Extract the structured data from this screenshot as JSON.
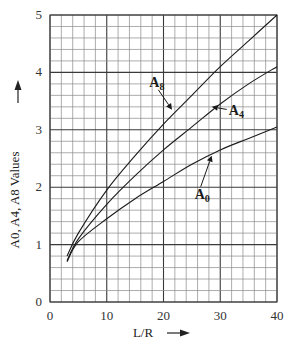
{
  "chart_data": {
    "type": "line",
    "title": "",
    "xlabel": "L/R",
    "ylabel": "A0, A4, A8 Values",
    "xlim": [
      0,
      40
    ],
    "ylim": [
      0,
      5
    ],
    "x_ticks": [
      "0",
      "10",
      "20",
      "30",
      "40"
    ],
    "y_ticks": [
      "0",
      "1",
      "2",
      "3",
      "4",
      "5"
    ],
    "x_major_step": 10,
    "x_minor_step": 2,
    "y_major_step": 1,
    "y_minor_step": 0.2,
    "grid": true,
    "legend": "inline-annotations",
    "series": [
      {
        "name": "A8",
        "label_main": "A",
        "label_sub": "8",
        "x": [
          3,
          5,
          10,
          15,
          20,
          25,
          30,
          35,
          40
        ],
        "y": [
          0.8,
          1.2,
          1.95,
          2.55,
          3.1,
          3.6,
          4.1,
          4.55,
          5.0
        ],
        "annotation": {
          "text_x": 17.5,
          "text_y": 3.75,
          "arrow_to_x": 21.5,
          "arrow_to_y": 3.35
        }
      },
      {
        "name": "A4",
        "label_main": "A",
        "label_sub": "4",
        "x": [
          3,
          5,
          10,
          15,
          20,
          25,
          30,
          35,
          40
        ],
        "y": [
          0.72,
          1.1,
          1.7,
          2.2,
          2.65,
          3.05,
          3.45,
          3.8,
          4.1
        ],
        "annotation": {
          "text_x": 31.5,
          "text_y": 3.25,
          "arrow_to_x": 28.5,
          "arrow_to_y": 3.4
        }
      },
      {
        "name": "A0",
        "label_main": "A",
        "label_sub": "0",
        "x": [
          3,
          5,
          10,
          15,
          20,
          25,
          30,
          35,
          40
        ],
        "y": [
          0.7,
          1.05,
          1.45,
          1.8,
          2.1,
          2.4,
          2.65,
          2.85,
          3.05
        ],
        "annotation": {
          "text_x": 25.5,
          "text_y": 1.8,
          "arrow_to_x": 28.5,
          "arrow_to_y": 2.55
        }
      }
    ],
    "xlabel_arrow": "right-arrow",
    "ylabel_arrow": "up-arrow"
  }
}
